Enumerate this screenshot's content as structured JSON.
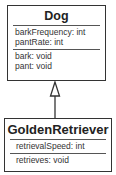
{
  "diagram": {
    "type": "uml-class-diagram",
    "classes": [
      {
        "name": "Dog",
        "attributes": [
          "barkFrequency: int",
          "pantRate: int"
        ],
        "methods": [
          "bark: void",
          "pant: void"
        ]
      },
      {
        "name": "GoldenRetriever",
        "attributes": [
          "retrievalSpeed: int"
        ],
        "methods": [
          "retrieves: void"
        ]
      }
    ],
    "relationships": [
      {
        "type": "inheritance",
        "from": "GoldenRetriever",
        "to": "Dog"
      }
    ],
    "colors": {
      "border": "#333333",
      "text": "#222222",
      "background": "#ffffff"
    }
  }
}
